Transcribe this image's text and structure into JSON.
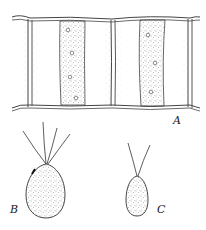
{
  "figure": {
    "type": "scientific line drawing",
    "panels": [
      {
        "id": "A",
        "label": "A",
        "subject": "filament of two cells with band-shaped chloroplasts containing pyrenoids"
      },
      {
        "id": "B",
        "label": "B",
        "subject": "quadriflagellate zoospore"
      },
      {
        "id": "C",
        "label": "C",
        "subject": "biflagellate gamete"
      }
    ],
    "colors": {
      "ink": "#333333",
      "background": "#ffffff"
    }
  }
}
